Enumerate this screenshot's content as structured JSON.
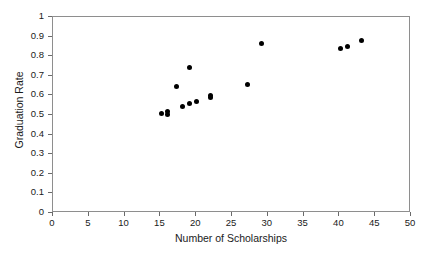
{
  "chart_data": {
    "type": "scatter",
    "title": "",
    "xlabel": "Number of Scholarships",
    "ylabel": "Graduation Rate",
    "xlim": [
      0,
      50
    ],
    "ylim": [
      0,
      1
    ],
    "grid": false,
    "legend": "none",
    "marker": {
      "shape": "circle",
      "color": "#000000",
      "size_px": 5
    },
    "xticks": [
      "0",
      "5",
      "10",
      "15",
      "20",
      "25",
      "30",
      "35",
      "40",
      "45",
      "50"
    ],
    "xtick_values": [
      0,
      5,
      10,
      15,
      20,
      25,
      30,
      35,
      40,
      45,
      50
    ],
    "yticks": [
      "0",
      "0.1",
      "0.2",
      "0.3",
      "0.4",
      "0.5",
      "0.6",
      "0.7",
      "0.8",
      "0.9",
      "1"
    ],
    "ytick_values": [
      0,
      0.1,
      0.2,
      0.3,
      0.4,
      0.5,
      0.6,
      0.7,
      0.8,
      0.9,
      1
    ],
    "x": [
      15.1,
      16.0,
      16.0,
      17.2,
      18.1,
      19.0,
      19.1,
      20.1,
      22.0,
      22.0,
      27.1,
      29.1,
      40.2,
      41.1,
      43.1
    ],
    "y": [
      0.51,
      0.518,
      0.503,
      0.646,
      0.541,
      0.744,
      0.558,
      0.57,
      0.6,
      0.588,
      0.657,
      0.864,
      0.841,
      0.849,
      0.88
    ],
    "points": [
      {
        "x": 15.1,
        "y": 0.51
      },
      {
        "x": 16.0,
        "y": 0.518
      },
      {
        "x": 16.0,
        "y": 0.503
      },
      {
        "x": 17.2,
        "y": 0.646
      },
      {
        "x": 18.1,
        "y": 0.541
      },
      {
        "x": 19.0,
        "y": 0.744
      },
      {
        "x": 19.1,
        "y": 0.558
      },
      {
        "x": 20.1,
        "y": 0.57
      },
      {
        "x": 22.0,
        "y": 0.6
      },
      {
        "x": 22.0,
        "y": 0.588
      },
      {
        "x": 27.1,
        "y": 0.657
      },
      {
        "x": 29.1,
        "y": 0.864
      },
      {
        "x": 40.2,
        "y": 0.841
      },
      {
        "x": 41.1,
        "y": 0.849
      },
      {
        "x": 43.1,
        "y": 0.88
      }
    ]
  },
  "figure": {
    "background_color": "#ffffff",
    "frame_color": "#8e8e8e",
    "tick_color": "#6a6a6a",
    "text_color": "#1a1a1a",
    "top_artifact": "."
  }
}
